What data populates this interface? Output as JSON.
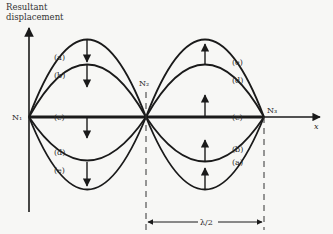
{
  "diagram": {
    "axis_title_line1": "Resultant",
    "axis_title_line2": "displacement",
    "x_axis_label": "x",
    "nodes": [
      {
        "label": "N₁",
        "x": 29,
        "y": 117
      },
      {
        "label": "N₂",
        "x": 146,
        "y": 117
      },
      {
        "label": "N₃",
        "x": 264,
        "y": 117
      }
    ],
    "curve_labels": {
      "left_lobe": [
        "(a)",
        "(b)",
        "(c)",
        "(d)",
        "(e)"
      ],
      "right_lobe": [
        "(e)",
        "(d)",
        "(c)",
        "(b)",
        "(a)"
      ]
    },
    "wavelength_label": "λ/2",
    "colors": {
      "line": "#1a1a1a",
      "background": "#f7f7f5"
    }
  }
}
